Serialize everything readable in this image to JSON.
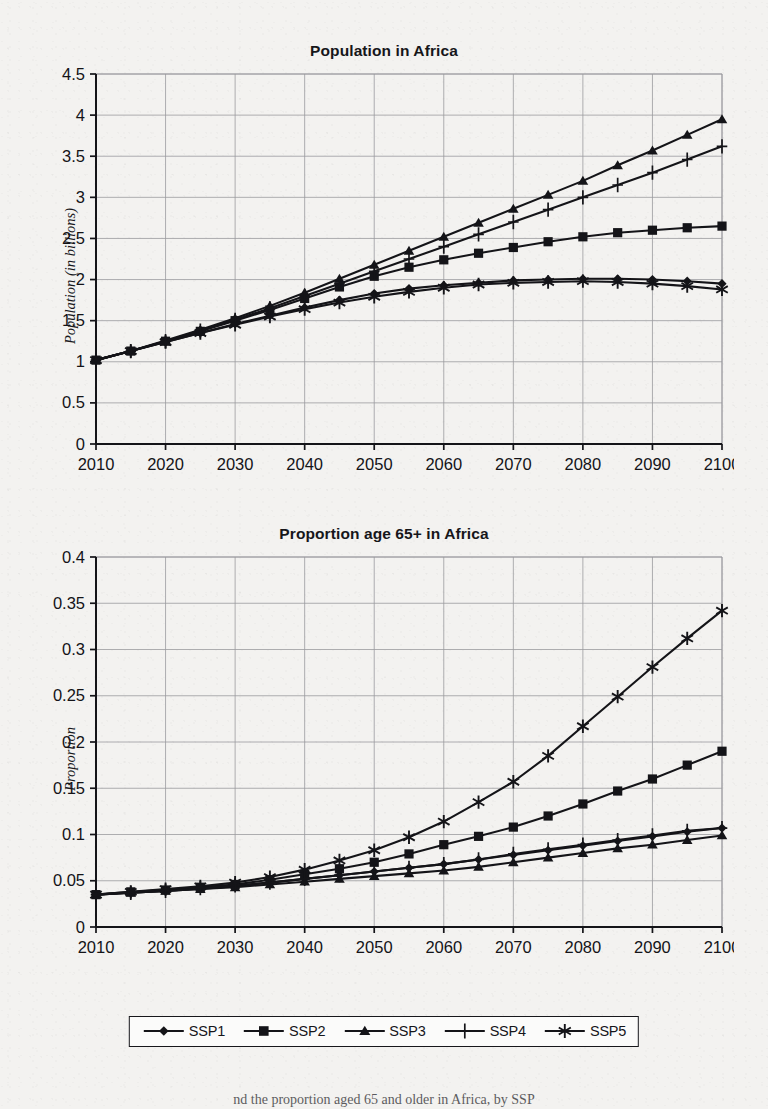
{
  "figure": {
    "background_color": "#f3f2f0",
    "ink_color": "#141418",
    "grid_color": "#9a9a9e",
    "caption_fragment": "nd the proportion aged 65 and older in Africa, by SSP"
  },
  "legend": {
    "name": "scenario-legend",
    "items": [
      {
        "label": "SSP1",
        "marker": "diamond"
      },
      {
        "label": "SSP2",
        "marker": "square"
      },
      {
        "label": "SSP3",
        "marker": "triangle"
      },
      {
        "label": "SSP4",
        "marker": "plus"
      },
      {
        "label": "SSP5",
        "marker": "asterisk"
      }
    ]
  },
  "chart_data": [
    {
      "id": "population-in-africa",
      "type": "line",
      "title": "Population in Africa",
      "xlabel": "",
      "ylabel": "Population (in billions)",
      "x": [
        2010,
        2015,
        2020,
        2025,
        2030,
        2035,
        2040,
        2045,
        2050,
        2055,
        2060,
        2065,
        2070,
        2075,
        2080,
        2085,
        2090,
        2095,
        2100
      ],
      "xlim": [
        2010,
        2100
      ],
      "ylim": [
        0,
        4.5
      ],
      "xticks": [
        2010,
        2020,
        2030,
        2040,
        2050,
        2060,
        2070,
        2080,
        2090,
        2100
      ],
      "yticks": [
        0,
        0.5,
        1,
        1.5,
        2,
        2.5,
        3,
        3.5,
        4,
        4.5
      ],
      "ytick_labels": [
        "0",
        "0.5",
        "1",
        "1.5",
        "2",
        "2.5",
        "3",
        "3.5",
        "4",
        "4.5"
      ],
      "grid": true,
      "legend_position": "below-figure",
      "series": [
        {
          "name": "SSP1",
          "marker": "diamond",
          "values": [
            1.02,
            1.13,
            1.24,
            1.35,
            1.46,
            1.56,
            1.66,
            1.75,
            1.83,
            1.89,
            1.93,
            1.96,
            1.99,
            2.0,
            2.01,
            2.01,
            2.0,
            1.98,
            1.95
          ]
        },
        {
          "name": "SSP2",
          "marker": "square",
          "values": [
            1.02,
            1.13,
            1.25,
            1.37,
            1.5,
            1.63,
            1.77,
            1.91,
            2.04,
            2.15,
            2.24,
            2.32,
            2.39,
            2.46,
            2.52,
            2.57,
            2.6,
            2.63,
            2.65
          ]
        },
        {
          "name": "SSP3",
          "marker": "triangle",
          "values": [
            1.02,
            1.13,
            1.26,
            1.39,
            1.53,
            1.68,
            1.84,
            2.01,
            2.18,
            2.35,
            2.52,
            2.69,
            2.86,
            3.03,
            3.2,
            3.39,
            3.57,
            3.76,
            3.95
          ]
        },
        {
          "name": "SSP4",
          "marker": "plus",
          "values": [
            1.02,
            1.13,
            1.25,
            1.38,
            1.51,
            1.65,
            1.8,
            1.95,
            2.1,
            2.25,
            2.4,
            2.55,
            2.7,
            2.85,
            3.0,
            3.15,
            3.3,
            3.46,
            3.62
          ]
        },
        {
          "name": "SSP5",
          "marker": "asterisk",
          "values": [
            1.02,
            1.13,
            1.24,
            1.35,
            1.45,
            1.55,
            1.64,
            1.72,
            1.79,
            1.85,
            1.9,
            1.94,
            1.96,
            1.97,
            1.98,
            1.97,
            1.95,
            1.92,
            1.88
          ]
        }
      ]
    },
    {
      "id": "proportion-age-65-plus-in-africa",
      "type": "line",
      "title": "Proportion age 65+ in Africa",
      "xlabel": "",
      "ylabel": "Proportion",
      "x": [
        2010,
        2015,
        2020,
        2025,
        2030,
        2035,
        2040,
        2045,
        2050,
        2055,
        2060,
        2065,
        2070,
        2075,
        2080,
        2085,
        2090,
        2095,
        2100
      ],
      "xlim": [
        2010,
        2100
      ],
      "ylim": [
        0,
        0.4
      ],
      "xticks": [
        2010,
        2020,
        2030,
        2040,
        2050,
        2060,
        2070,
        2080,
        2090,
        2100
      ],
      "yticks": [
        0,
        0.05,
        0.1,
        0.15,
        0.2,
        0.25,
        0.3,
        0.35,
        0.4
      ],
      "ytick_labels": [
        "0",
        "0.05",
        "0.1",
        "0.15",
        "0.2",
        "0.25",
        "0.3",
        "0.35",
        "0.4"
      ],
      "grid": true,
      "legend_position": "below-figure",
      "series": [
        {
          "name": "SSP1",
          "marker": "diamond",
          "values": [
            0.035,
            0.037,
            0.039,
            0.041,
            0.044,
            0.048,
            0.052,
            0.056,
            0.06,
            0.064,
            0.068,
            0.073,
            0.078,
            0.083,
            0.088,
            0.093,
            0.098,
            0.103,
            0.107
          ]
        },
        {
          "name": "SSP2",
          "marker": "square",
          "values": [
            0.035,
            0.038,
            0.04,
            0.043,
            0.046,
            0.051,
            0.057,
            0.063,
            0.07,
            0.079,
            0.089,
            0.098,
            0.108,
            0.12,
            0.133,
            0.147,
            0.16,
            0.175,
            0.19
          ]
        },
        {
          "name": "SSP3",
          "marker": "triangle",
          "values": [
            0.035,
            0.037,
            0.039,
            0.041,
            0.043,
            0.046,
            0.049,
            0.052,
            0.055,
            0.058,
            0.061,
            0.065,
            0.07,
            0.075,
            0.08,
            0.085,
            0.089,
            0.094,
            0.099
          ]
        },
        {
          "name": "SSP4",
          "marker": "plus",
          "values": [
            0.035,
            0.037,
            0.039,
            0.042,
            0.045,
            0.048,
            0.052,
            0.056,
            0.06,
            0.064,
            0.068,
            0.073,
            0.079,
            0.084,
            0.089,
            0.094,
            0.099,
            0.104,
            0.107
          ]
        },
        {
          "name": "SSP5",
          "marker": "asterisk",
          "values": [
            0.035,
            0.038,
            0.041,
            0.044,
            0.048,
            0.054,
            0.062,
            0.072,
            0.083,
            0.097,
            0.114,
            0.135,
            0.157,
            0.185,
            0.217,
            0.249,
            0.281,
            0.312,
            0.342,
            0.372
          ]
        }
      ]
    }
  ]
}
